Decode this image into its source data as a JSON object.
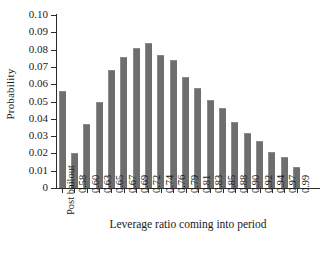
{
  "chart_data": {
    "type": "bar",
    "title": "",
    "xlabel": "Leverage ratio coming into period",
    "ylabel": "Probability",
    "ylim": [
      0,
      0.1
    ],
    "ytick_labels": [
      "0.10",
      "0.09",
      "0.08",
      "0.07",
      "0.06",
      "0.05",
      "0.04",
      "0.03",
      "0.02",
      "0.01",
      "0"
    ],
    "ytick_values": [
      0.1,
      0.09,
      0.08,
      0.07,
      0.06,
      0.05,
      0.04,
      0.03,
      0.02,
      0.01,
      0
    ],
    "grid": false,
    "legend": null,
    "bar_color": "#6e6e6e",
    "categories": [
      "Post bailout",
      "0.58",
      "0.60",
      "0.63",
      "0.65",
      "0.67",
      "0.69",
      "0.72",
      "0.74",
      "0.76",
      "0.79",
      "0.81",
      "0.83",
      "0.85",
      "0.88",
      "0.90",
      "0.92",
      "0.94",
      "0.97",
      "0.99"
    ],
    "values": [
      0.056,
      0.02,
      0.037,
      0.05,
      0.068,
      0.076,
      0.081,
      0.084,
      0.077,
      0.074,
      0.064,
      0.058,
      0.051,
      0.046,
      0.038,
      0.032,
      0.027,
      0.021,
      0.018,
      0.012
    ]
  }
}
